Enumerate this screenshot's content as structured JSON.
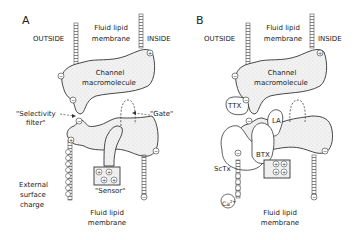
{
  "panels": [
    {
      "id": "A",
      "letter": "A",
      "outside": "OUTSIDE",
      "inside": "INSIDE",
      "membrane_top_1": "Fluid lipid",
      "membrane_top_2": "membrane",
      "channel_1": "Channel",
      "channel_2": "macromolecule",
      "selectivity_1": "\"Selectivity",
      "selectivity_2": "filter\"",
      "gate": "\"Gate\"",
      "sensor": "\"Sensor\"",
      "surface_1": "External",
      "surface_2": "surface",
      "surface_3": "charge",
      "membrane_bottom_1": "Fluid lipid",
      "membrane_bottom_2": "membrane"
    },
    {
      "id": "B",
      "letter": "B",
      "outside": "OUTSIDE",
      "inside": "INSIDE",
      "membrane_top_1": "Fluid lipid",
      "membrane_top_2": "membrane",
      "channel_1": "Channel",
      "channel_2": "macromolecule",
      "ttx": "TTX",
      "la": "LA",
      "btx": "BTX",
      "sctx": "ScTx",
      "ca": "Ca",
      "ca_sup": "2+",
      "membrane_bottom_1": "Fluid lipid",
      "membrane_bottom_2": "membrane"
    }
  ],
  "charges": {
    "plus": "+",
    "minus": "−"
  }
}
